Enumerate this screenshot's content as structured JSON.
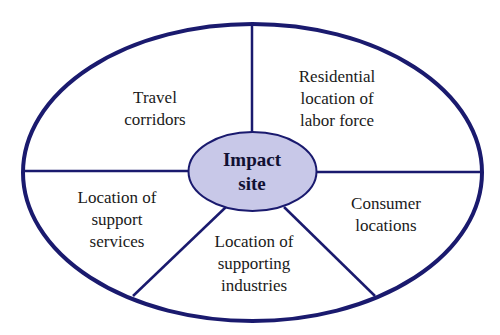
{
  "diagram": {
    "colors": {
      "stroke": "#1a1a6e",
      "center_fill": "#c8c8e8",
      "background": "#ffffff"
    },
    "center": {
      "label": "Impact\nsite"
    },
    "sectors": [
      {
        "id": "travel-corridors",
        "label": "Travel\ncorridors"
      },
      {
        "id": "residential-location",
        "label": "Residential\nlocation of\nlabor force"
      },
      {
        "id": "consumer-locations",
        "label": "Consumer\nlocations"
      },
      {
        "id": "supporting-industries",
        "label": "Location of\nsupporting\nindustries"
      },
      {
        "id": "support-services",
        "label": "Location of\nsupport\nservices"
      }
    ]
  }
}
